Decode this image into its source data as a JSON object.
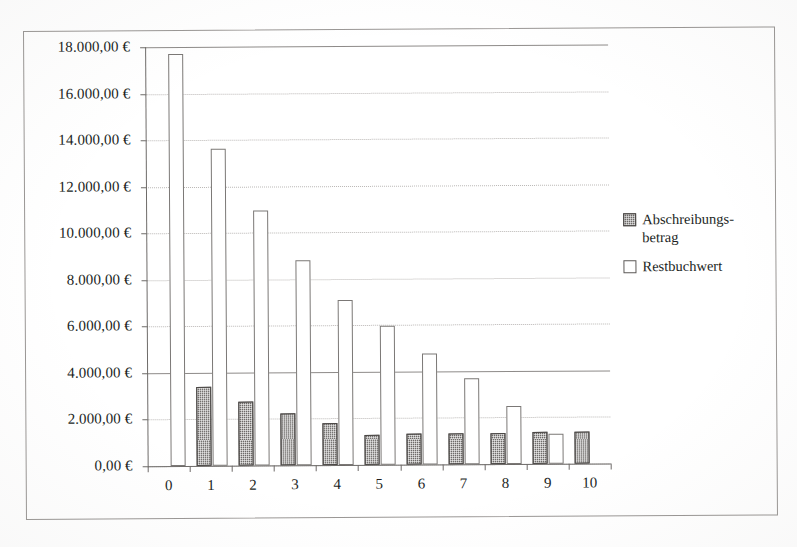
{
  "chart_data": {
    "type": "bar",
    "title": "",
    "subtitle": "",
    "xlabel": "",
    "ylabel": "",
    "categories": [
      "0",
      "1",
      "2",
      "3",
      "4",
      "5",
      "6",
      "7",
      "8",
      "9",
      "10"
    ],
    "ylim": [
      0,
      18000
    ],
    "ytick_values": [
      0,
      2000,
      4000,
      6000,
      8000,
      10000,
      12000,
      14000,
      16000,
      18000
    ],
    "ytick_labels": [
      "0,00 €",
      "2.000,00 €",
      "4.000,00 €",
      "6.000,00 €",
      "8.000,00 €",
      "10.000,00 €",
      "12.000,00 €",
      "14.000,00 €",
      "16.000,00 €",
      "18.000,00 €"
    ],
    "grid": true,
    "legend_position": "right",
    "series": [
      {
        "name": "Abschreibungs-\nbetrag",
        "legend_label": "Abschreibungs-betrag",
        "style": "dark-hatched",
        "color": "#6d6a68",
        "values": [
          0,
          3400,
          2750,
          2250,
          1820,
          1300,
          1330,
          1330,
          1330,
          1360,
          1380
        ]
      },
      {
        "name": "Restbuchwert",
        "legend_label": "Restbuchwert",
        "style": "white-outlined",
        "color": "#ffffff",
        "values": [
          17700,
          13600,
          10950,
          8800,
          7080,
          5950,
          4780,
          3680,
          2500,
          1300,
          0
        ]
      }
    ]
  },
  "legend": {
    "items": [
      {
        "label": "Abschreibungs-\nbetrag",
        "swatch": "dark"
      },
      {
        "label": "Restbuchwert",
        "swatch": "light"
      }
    ]
  }
}
